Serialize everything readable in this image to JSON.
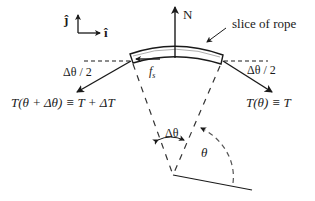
{
  "diagram": {
    "axes": {
      "j_label": "ĵ",
      "i_label": "î"
    },
    "labels": {
      "normal_force": "N",
      "slice_label": "slice of rope",
      "friction": "f",
      "friction_sub": "s",
      "half_angle_left": "Δθ / 2",
      "half_angle_right": "Δθ / 2",
      "tension_left": "T(θ + Δθ) ≡ T + ΔT",
      "tension_right": "T(θ) ≡ T",
      "delta_theta": "Δθ",
      "theta": "θ"
    },
    "colors": {
      "ink": "#1a1a1a",
      "rope_fill": "#ffffff",
      "dashed": "#333333",
      "background": "#ffffff"
    }
  }
}
